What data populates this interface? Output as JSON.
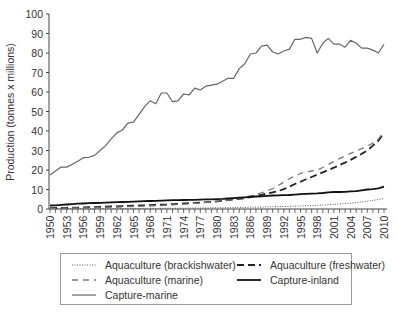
{
  "chart_data": {
    "type": "line",
    "title": "",
    "xlabel": "",
    "ylabel": "Production (tonnes x millions)",
    "ylim": [
      0,
      100
    ],
    "yticks": [
      0,
      10,
      20,
      30,
      40,
      50,
      60,
      70,
      80,
      90,
      100
    ],
    "xtick_labels": [
      "1950",
      "1953",
      "1956",
      "1959",
      "1962",
      "1965",
      "1968",
      "1971",
      "1974",
      "1977",
      "1980",
      "1983",
      "1886",
      "1989",
      "1992",
      "1995",
      "1998",
      "2001",
      "2004",
      "2007",
      "2010"
    ],
    "grid": false,
    "legend_position": "bottom",
    "x": [
      1950,
      1951,
      1952,
      1953,
      1954,
      1955,
      1956,
      1957,
      1958,
      1959,
      1960,
      1961,
      1962,
      1963,
      1964,
      1965,
      1966,
      1967,
      1968,
      1969,
      1970,
      1971,
      1972,
      1973,
      1974,
      1975,
      1976,
      1977,
      1978,
      1979,
      1980,
      1981,
      1982,
      1983,
      1984,
      1985,
      1986,
      1987,
      1988,
      1989,
      1990,
      1991,
      1992,
      1993,
      1994,
      1995,
      1996,
      1997,
      1998,
      1999,
      2000,
      2001,
      2002,
      2003,
      2004,
      2005,
      2006,
      2007,
      2008,
      2009,
      2010
    ],
    "series": [
      {
        "name": "Aquaculture (brackishwater)",
        "style": "dotted",
        "values": [
          0.1,
          0.1,
          0.1,
          0.1,
          0.1,
          0.1,
          0.1,
          0.1,
          0.2,
          0.2,
          0.2,
          0.2,
          0.2,
          0.2,
          0.2,
          0.3,
          0.3,
          0.3,
          0.3,
          0.3,
          0.3,
          0.4,
          0.4,
          0.4,
          0.4,
          0.5,
          0.5,
          0.5,
          0.5,
          0.6,
          0.6,
          0.6,
          0.7,
          0.7,
          0.8,
          0.8,
          0.9,
          1.0,
          1.0,
          1.1,
          1.2,
          1.2,
          1.3,
          1.4,
          1.5,
          1.6,
          1.7,
          1.8,
          1.9,
          2.0,
          2.2,
          2.4,
          2.6,
          2.8,
          3.0,
          3.3,
          3.6,
          4.0,
          4.4,
          4.8,
          5.5
        ]
      },
      {
        "name": "Aquaculture (freshwater)",
        "style": "dashed",
        "values": [
          0.4,
          0.5,
          0.5,
          0.6,
          0.7,
          0.7,
          0.8,
          0.9,
          1.0,
          1.1,
          1.2,
          1.3,
          1.4,
          1.5,
          1.6,
          1.7,
          1.8,
          1.9,
          2.0,
          2.1,
          2.2,
          2.3,
          2.5,
          2.6,
          2.8,
          3.0,
          3.1,
          3.3,
          3.5,
          3.7,
          3.9,
          4.2,
          4.5,
          4.8,
          5.2,
          5.6,
          6.1,
          6.7,
          7.3,
          7.9,
          8.5,
          9.2,
          10.2,
          11.5,
          12.8,
          14.0,
          15.3,
          16.4,
          17.6,
          18.8,
          20.0,
          21.2,
          22.5,
          23.8,
          25.2,
          26.7,
          28.3,
          30.0,
          32.5,
          35.0,
          39.0
        ]
      },
      {
        "name": "Aquaculture (marine)",
        "style": "longdash",
        "values": [
          0.3,
          0.3,
          0.4,
          0.4,
          0.5,
          0.5,
          0.6,
          0.6,
          0.7,
          0.8,
          0.8,
          0.9,
          1.0,
          1.1,
          1.2,
          1.3,
          1.4,
          1.5,
          1.6,
          1.7,
          1.8,
          2.0,
          2.1,
          2.3,
          2.5,
          2.7,
          2.9,
          3.1,
          3.4,
          3.7,
          4.0,
          4.3,
          4.6,
          5.0,
          5.5,
          6.0,
          6.7,
          7.5,
          8.3,
          9.3,
          10.5,
          12.0,
          13.8,
          15.5,
          17.0,
          18.2,
          19.0,
          19.5,
          20.0,
          21.3,
          22.8,
          24.3,
          25.8,
          27.2,
          28.5,
          29.8,
          31.0,
          32.3,
          33.8,
          36.0,
          39.5
        ]
      },
      {
        "name": "Capture-inland",
        "style": "solid-thick",
        "values": [
          1.8,
          1.9,
          2.1,
          2.3,
          2.5,
          2.7,
          2.8,
          3.0,
          3.1,
          3.2,
          3.3,
          3.4,
          3.5,
          3.6,
          3.7,
          3.8,
          3.9,
          4.0,
          4.1,
          4.2,
          4.3,
          4.4,
          4.5,
          4.5,
          4.6,
          4.7,
          4.7,
          4.8,
          4.9,
          5.0,
          5.1,
          5.2,
          5.4,
          5.6,
          5.8,
          6.0,
          6.2,
          6.4,
          6.5,
          6.7,
          6.9,
          7.0,
          7.1,
          7.2,
          7.4,
          7.6,
          7.8,
          7.9,
          8.0,
          8.2,
          8.5,
          8.7,
          8.7,
          8.8,
          9.0,
          9.2,
          9.6,
          10.0,
          10.2,
          10.6,
          11.5
        ]
      },
      {
        "name": "Capture-marine",
        "style": "solid-thin",
        "values": [
          17.5,
          19.5,
          21.5,
          21.5,
          23.0,
          24.5,
          26.3,
          26.5,
          27.5,
          30.0,
          32.5,
          36.0,
          39.0,
          40.5,
          44.0,
          44.5,
          48.5,
          52.5,
          55.5,
          54.0,
          59.5,
          59.5,
          55.0,
          55.5,
          59.0,
          58.5,
          62.0,
          61.0,
          63.0,
          63.5,
          64.0,
          65.5,
          67.0,
          67.0,
          72.0,
          74.5,
          79.5,
          80.0,
          83.5,
          84.0,
          80.5,
          79.5,
          81.0,
          82.0,
          87.0,
          87.0,
          88.0,
          87.5,
          80.0,
          85.0,
          87.5,
          84.5,
          84.5,
          83.0,
          86.5,
          85.0,
          82.5,
          82.5,
          81.5,
          80.0,
          84.5
        ]
      }
    ]
  },
  "legend": {
    "items": [
      {
        "label": "Aquaculture (brackishwater)"
      },
      {
        "label": "Aquaculture (freshwater)"
      },
      {
        "label": "Aquaculture (marine)"
      },
      {
        "label": "Capture-inland"
      },
      {
        "label": "Capture-marine"
      }
    ]
  }
}
